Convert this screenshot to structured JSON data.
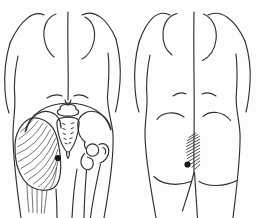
{
  "illustration": {
    "name": "posterior-torso-trigger-point-diagram",
    "background": "#fdfdfd",
    "ink": "#2f2f2f",
    "detail_ink": "#3a3a3a",
    "marker_ink": "#161616",
    "left_panel": {
      "content": "back view with pelvis bones and gluteal muscle fibers",
      "trigger_point": {
        "cx": 58,
        "cy": 158,
        "r": 3.1
      }
    },
    "right_panel": {
      "content": "back view with hatched referred-pain area above gluteal cleft",
      "trigger_point": {
        "cx": 187.5,
        "cy": 164.5,
        "r": 3.1
      }
    }
  }
}
